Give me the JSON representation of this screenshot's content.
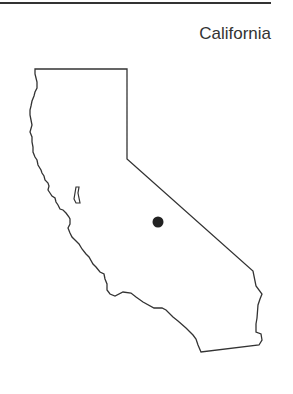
{
  "map": {
    "title": "California",
    "marker": {
      "x": 158,
      "y": 222,
      "color": "#222222"
    },
    "outline_color": "#333333"
  }
}
